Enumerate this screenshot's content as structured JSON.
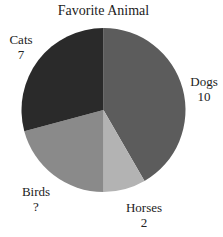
{
  "chart_data": {
    "type": "pie",
    "title": "Favorite Animal",
    "categories": [
      "Dogs",
      "Horses",
      "Birds",
      "Cats"
    ],
    "values": [
      10,
      2,
      5,
      7
    ],
    "value_labels": [
      "10",
      "2",
      "?",
      "7"
    ],
    "colors": [
      "#5c5c5c",
      "#b3b3b3",
      "#8a8a8a",
      "#2a2a2a"
    ],
    "start_angle": "top, clockwise",
    "legend": "none (labels outside slices)"
  },
  "labels": {
    "dogs": {
      "name": "Dogs",
      "value": "10"
    },
    "horses": {
      "name": "Horses",
      "value": "2"
    },
    "birds": {
      "name": "Birds",
      "value": "?"
    },
    "cats": {
      "name": "Cats",
      "value": "7"
    }
  }
}
